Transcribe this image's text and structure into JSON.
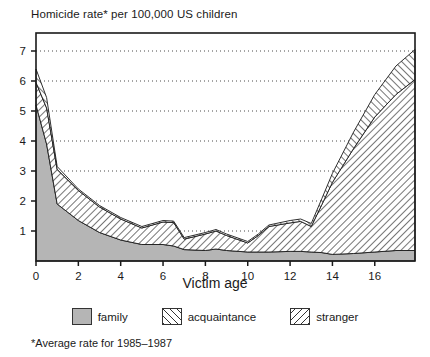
{
  "chart_data": {
    "type": "area",
    "title": "Homicide rate* per 100,000 US children",
    "xlabel": "Victim age",
    "ylabel": "",
    "xlim": [
      0,
      17.9
    ],
    "ylim": [
      0,
      7.6
    ],
    "grid": true,
    "stacked": true,
    "legend_position": "bottom",
    "footnote": "*Average rate for 1985–1987",
    "xticks": [
      0,
      2,
      4,
      6,
      8,
      10,
      12,
      14,
      16
    ],
    "xtick_labels": [
      "0",
      "2",
      "4",
      "6",
      "8",
      "10",
      "12",
      "14",
      "16"
    ],
    "yticks": [
      1,
      2,
      3,
      4,
      5,
      6,
      7
    ],
    "ytick_labels": [
      "1",
      "2",
      "3",
      "4",
      "5",
      "6",
      "7"
    ],
    "x": [
      0,
      0.5,
      1,
      2,
      3,
      4,
      5,
      6,
      6.5,
      7,
      8,
      8.5,
      9,
      10,
      10.5,
      11,
      12,
      12.5,
      13,
      13.5,
      14,
      15,
      16,
      17,
      17.9
    ],
    "series": [
      {
        "name": "family",
        "color": "#b5b5b5",
        "pattern": "solid",
        "values": [
          5.2,
          3.9,
          1.9,
          1.35,
          0.95,
          0.7,
          0.55,
          0.55,
          0.5,
          0.38,
          0.35,
          0.4,
          0.35,
          0.3,
          0.3,
          0.3,
          0.32,
          0.32,
          0.3,
          0.28,
          0.22,
          0.25,
          0.3,
          0.35,
          0.35
        ]
      },
      {
        "name": "acquaintance",
        "color": "#ffffff",
        "pattern": "hatch-forward",
        "values": [
          0.75,
          1.2,
          1.15,
          1.0,
          0.85,
          0.7,
          0.55,
          0.75,
          0.78,
          0.35,
          0.55,
          0.6,
          0.5,
          0.3,
          0.55,
          0.85,
          0.95,
          1.0,
          0.85,
          1.6,
          2.4,
          3.5,
          4.5,
          5.2,
          5.7
        ]
      },
      {
        "name": "stranger",
        "color": "#ffffff",
        "pattern": "hatch-backward",
        "values": [
          0.45,
          0.35,
          0.1,
          0.05,
          0.05,
          0.05,
          0.05,
          0.05,
          0.05,
          0.05,
          0.05,
          0.05,
          0.05,
          0.05,
          0.05,
          0.05,
          0.08,
          0.08,
          0.1,
          0.2,
          0.3,
          0.55,
          0.75,
          0.95,
          1.0
        ]
      }
    ]
  },
  "legend": {
    "items": [
      {
        "label": "family",
        "key": "family"
      },
      {
        "label": "acquaintance",
        "key": "acquaintance"
      },
      {
        "label": "stranger",
        "key": "stranger"
      }
    ]
  }
}
